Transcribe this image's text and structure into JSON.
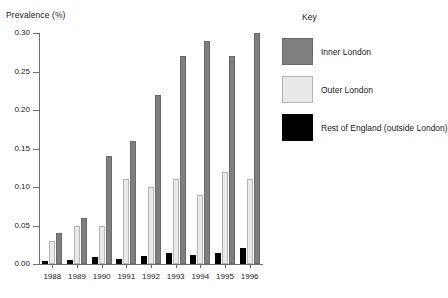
{
  "chart_data": {
    "type": "bar",
    "title": "",
    "xlabel": "",
    "ylabel": "Prevalence (%)",
    "categories": [
      "1988",
      "1989",
      "1990",
      "1991",
      "1992",
      "1993",
      "1994",
      "1995",
      "1996"
    ],
    "ylim": [
      0.0,
      0.3
    ],
    "ytick_labels": [
      "0.00",
      "0.05",
      "0.10",
      "0.15",
      "0.20",
      "0.25",
      "0.30"
    ],
    "ytick_values": [
      0.0,
      0.05,
      0.1,
      0.15,
      0.2,
      0.25,
      0.3
    ],
    "grid": false,
    "legend_position": "right",
    "legend_title": "Key",
    "series": [
      {
        "name": "Rest of England (outside London)",
        "color": "#000000",
        "values": [
          0.004,
          0.005,
          0.009,
          0.007,
          0.011,
          0.014,
          0.012,
          0.014,
          0.021
        ]
      },
      {
        "name": "Outer London",
        "color": "#e9e9e9",
        "values": [
          0.03,
          0.05,
          0.05,
          0.11,
          0.1,
          0.11,
          0.09,
          0.12,
          0.11
        ]
      },
      {
        "name": "Inner London",
        "color": "#7f7f7f",
        "values": [
          0.04,
          0.06,
          0.14,
          0.16,
          0.22,
          0.27,
          0.29,
          0.27,
          0.3
        ]
      }
    ]
  },
  "legend": {
    "title": "Key",
    "items": [
      {
        "label": "Inner London",
        "swatch": "inner"
      },
      {
        "label": "Outer London",
        "swatch": "outer"
      },
      {
        "label": "Rest of England (outside London)",
        "swatch": "rest"
      }
    ]
  }
}
